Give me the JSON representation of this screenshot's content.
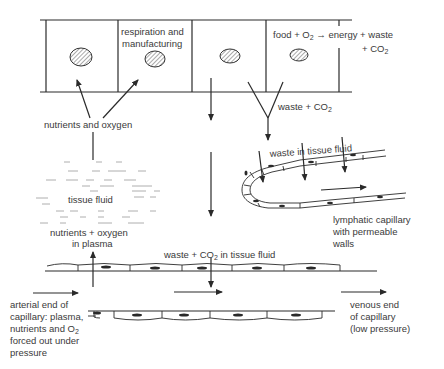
{
  "diagram": {
    "labels": {
      "respiration_line1": "respiration and",
      "respiration_line2": "manufacturing",
      "equation_line1_a": "food + O",
      "equation_line1_sub": "2",
      "equation_line1_b": " → energy + waste",
      "equation_line2_a": "+ CO",
      "equation_line2_sub": "2",
      "nutrients_oxygen": "nutrients and oxygen",
      "waste_co2_a": "waste + CO",
      "waste_co2_sub": "2",
      "waste_in_tissue_fluid": "waste in tissue fluid",
      "tissue_fluid": "tissue fluid",
      "nutrients_plasma_line1": "nutrients + oxygen",
      "nutrients_plasma_line2": "in plasma",
      "lymphatic_line1": "lymphatic capillary",
      "lymphatic_line2": "with permeable",
      "lymphatic_line3": "walls",
      "waste_co2_fluid_a": "waste + CO",
      "waste_co2_fluid_sub": "2",
      "waste_co2_fluid_b": " in tissue fluid",
      "arterial_line1": "arterial end of",
      "arterial_line2": "capillary: plasma,",
      "arterial_line3_a": "nutrients and O",
      "arterial_line3_sub": "2",
      "arterial_line4": "forced out under",
      "arterial_line5": "pressure",
      "venous_line1": "venous end",
      "venous_line2": "of capillary",
      "venous_line3": "(low pressure)"
    },
    "colors": {
      "line": "#2a2a2a",
      "text": "#3a3a3a",
      "background": "#ffffff"
    }
  }
}
